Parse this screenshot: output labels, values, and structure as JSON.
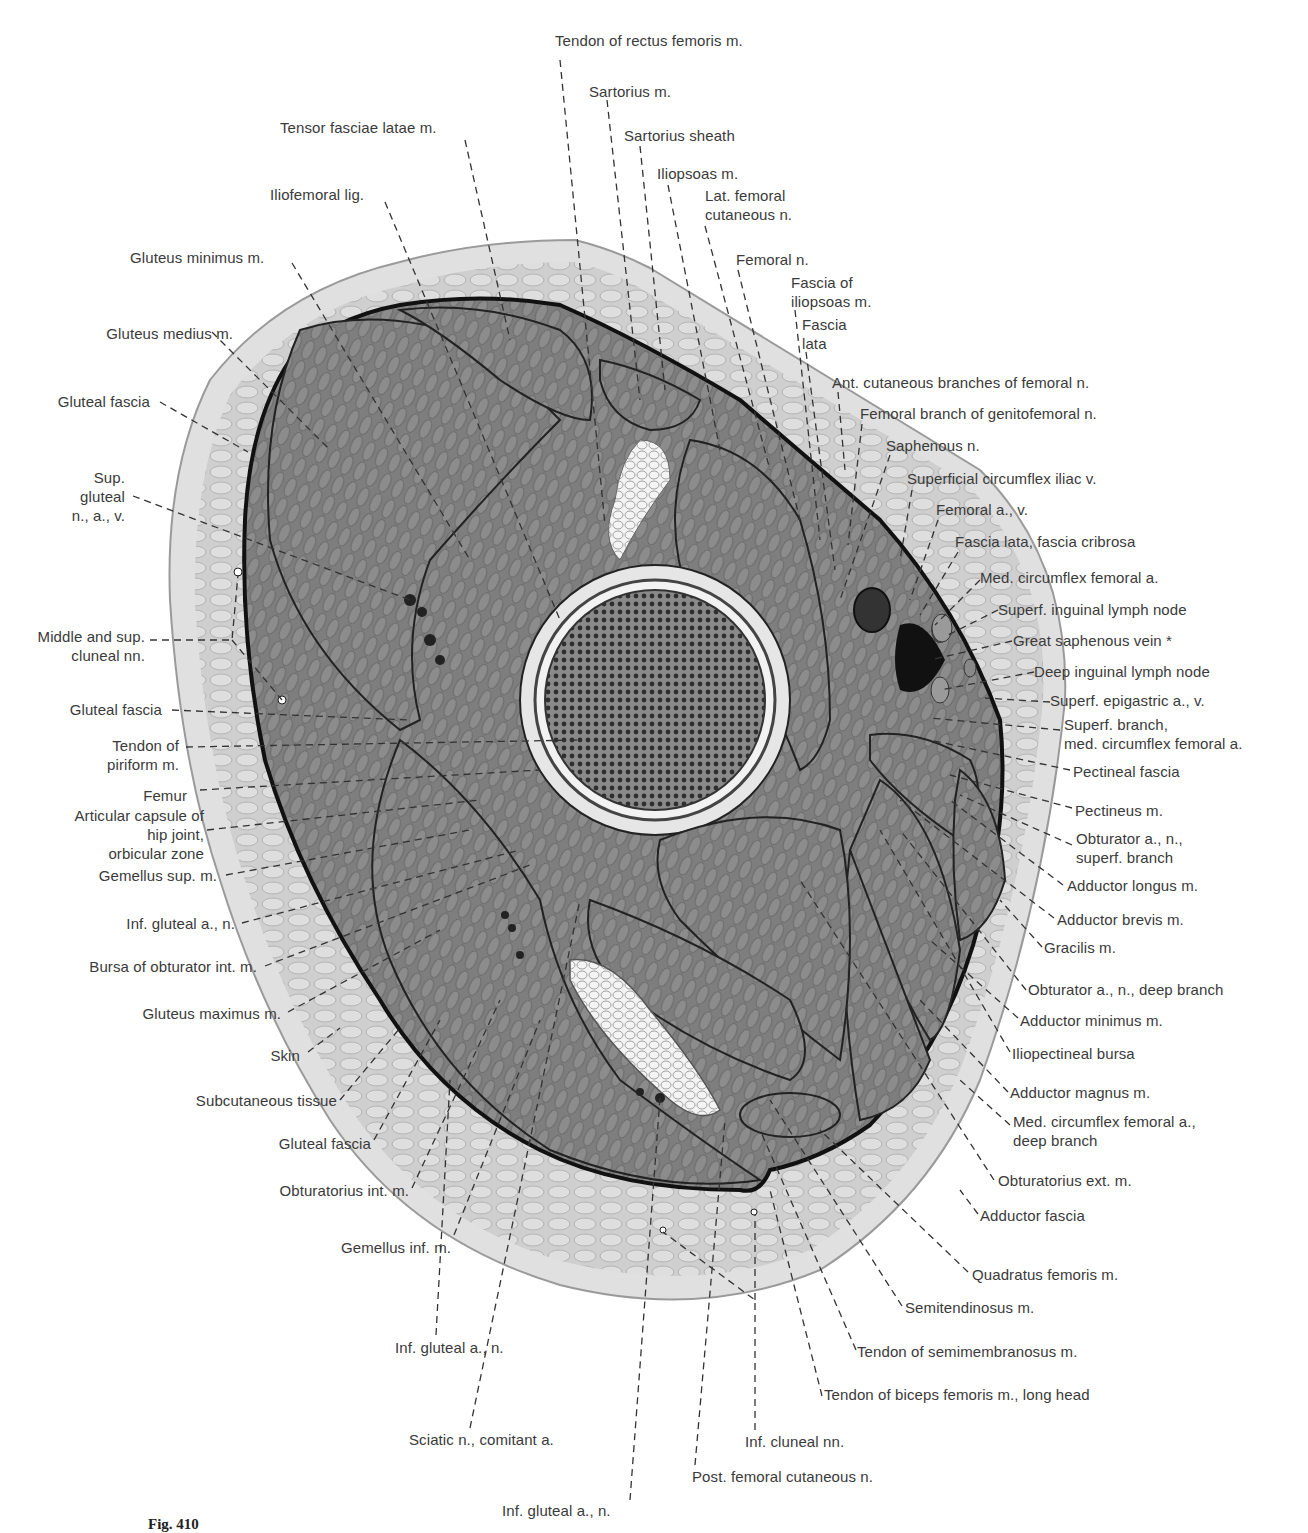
{
  "figure": {
    "caption_number": "Fig. 410"
  },
  "labels": {
    "top": [
      {
        "id": "tendon_rectus_femoris",
        "text": "Tendon of rectus femoris m.",
        "x": 555,
        "y": 40
      },
      {
        "id": "sartorius_m",
        "text": "Sartorius m.",
        "x": 589,
        "y": 82
      },
      {
        "id": "tensor_fasciae_latae",
        "text": "Tensor fasciae latae m.",
        "x": 280,
        "y": 118
      },
      {
        "id": "sartorius_sheath",
        "text": "Sartorius sheath",
        "x": 624,
        "y": 126
      },
      {
        "id": "iliopsoas_m",
        "text": "Iliopsoas m.",
        "x": 657,
        "y": 164
      },
      {
        "id": "iliofemoral_lig",
        "text": "Iliofemoral lig.",
        "x": 270,
        "y": 185
      },
      {
        "id": "lat_femoral_cutaneous",
        "text": "Lat. femoral\ncutaneous n.",
        "x": 705,
        "y": 186
      },
      {
        "id": "gluteus_minimus",
        "text": "Gluteus minimus m.",
        "x": 130,
        "y": 248
      },
      {
        "id": "femoral_n",
        "text": "Femoral n.",
        "x": 736,
        "y": 250
      },
      {
        "id": "fascia_iliopsoas",
        "text": "Fascia of\niliopsoas m.",
        "x": 791,
        "y": 273
      },
      {
        "id": "fascia_lata",
        "text": "Fascia\nlata",
        "x": 802,
        "y": 315
      }
    ],
    "left": [
      {
        "id": "gluteus_medius",
        "text": "Gluteus medius m.",
        "x": 232,
        "y": 325
      },
      {
        "id": "gluteal_fascia_1",
        "text": "Gluteal fascia",
        "x": 150,
        "y": 392
      },
      {
        "id": "sup_gluteal",
        "text": "Sup.\ngluteal\nn., a., v.",
        "x": 125,
        "y": 468
      },
      {
        "id": "middle_sup_cluneal",
        "text": "Middle and sup.\ncluneal nn.",
        "x": 145,
        "y": 627
      },
      {
        "id": "gluteal_fascia_2",
        "text": "Gluteal fascia",
        "x": 162,
        "y": 701
      },
      {
        "id": "tendon_piriform",
        "text": "Tendon of\npiriform m.",
        "x": 179,
        "y": 736
      },
      {
        "id": "femur",
        "text": "Femur",
        "x": 187,
        "y": 787
      },
      {
        "id": "articular_capsule",
        "text": "Articular capsule of\nhip joint,\norbicular zone",
        "x": 204,
        "y": 807
      },
      {
        "id": "gemellus_sup",
        "text": "Gemellus sup. m.",
        "x": 217,
        "y": 866
      },
      {
        "id": "inf_gluteal_left",
        "text": "Inf. gluteal a., n.",
        "x": 235,
        "y": 915
      },
      {
        "id": "bursa_obturator_int",
        "text": "Bursa of obturator int. m.",
        "x": 257,
        "y": 958
      },
      {
        "id": "gluteus_maximus",
        "text": "Gluteus maximus m.",
        "x": 281,
        "y": 1005
      },
      {
        "id": "skin",
        "text": "Skin",
        "x": 300,
        "y": 1046
      },
      {
        "id": "subcutaneous_tissue",
        "text": "Subcutaneous tissue",
        "x": 337,
        "y": 1092
      },
      {
        "id": "gluteal_fascia_3",
        "text": "Gluteal fascia",
        "x": 371,
        "y": 1135
      },
      {
        "id": "obturatorius_int",
        "text": "Obturatorius int. m.",
        "x": 409,
        "y": 1182
      },
      {
        "id": "gemellus_inf",
        "text": "Gemellus inf. m.",
        "x": 451,
        "y": 1239
      }
    ],
    "right": [
      {
        "id": "ant_cutaneous_branches",
        "text": "Ant. cutaneous branches of femoral n.",
        "x": 832,
        "y": 374
      },
      {
        "id": "femoral_branch_genitofemoral",
        "text": "Femoral branch of genitofemoral n.",
        "x": 860,
        "y": 405
      },
      {
        "id": "saphenous_n",
        "text": "Saphenous n.",
        "x": 886,
        "y": 436
      },
      {
        "id": "superficial_circumflex_iliac_v",
        "text": "Superficial circumflex iliac v.",
        "x": 907,
        "y": 469
      },
      {
        "id": "femoral_a_v",
        "text": "Femoral a., v.",
        "x": 936,
        "y": 500
      },
      {
        "id": "fascia_lata_cribrosa",
        "text": "Fascia lata, fascia cribrosa",
        "x": 955,
        "y": 532
      },
      {
        "id": "med_circumflex_femoral_a",
        "text": "Med. circumflex femoral a.",
        "x": 980,
        "y": 568
      },
      {
        "id": "superf_inguinal_lymph_node",
        "text": "Superf. inguinal lymph node",
        "x": 998,
        "y": 600
      },
      {
        "id": "great_saphenous_vein",
        "text": "Great saphenous vein *",
        "x": 1013,
        "y": 631
      },
      {
        "id": "deep_inguinal_lymph_node",
        "text": "Deep inguinal lymph node",
        "x": 1034,
        "y": 662
      },
      {
        "id": "superf_epigastric",
        "text": "Superf. epigastric a., v.",
        "x": 1050,
        "y": 692
      },
      {
        "id": "superf_branch_med_circumflex",
        "text": "Superf. branch,\nmed. circumflex femoral a.",
        "x": 1064,
        "y": 716
      },
      {
        "id": "pectineal_fascia",
        "text": "Pectineal fascia",
        "x": 1073,
        "y": 762
      },
      {
        "id": "pectineus",
        "text": "Pectineus m.",
        "x": 1075,
        "y": 801
      },
      {
        "id": "obturator_superf_branch",
        "text": "Obturator a., n.,\nsuperf. branch",
        "x": 1076,
        "y": 830
      },
      {
        "id": "adductor_longus",
        "text": "Adductor longus m.",
        "x": 1067,
        "y": 876
      },
      {
        "id": "adductor_brevis",
        "text": "Adductor brevis m.",
        "x": 1057,
        "y": 910
      },
      {
        "id": "gracilis",
        "text": "Gracilis m.",
        "x": 1044,
        "y": 938
      },
      {
        "id": "obturator_deep_branch",
        "text": "Obturator a., n., deep branch",
        "x": 1028,
        "y": 980
      },
      {
        "id": "adductor_minimus",
        "text": "Adductor minimus m.",
        "x": 1020,
        "y": 1011
      },
      {
        "id": "iliopectineal_bursa",
        "text": "Iliopectineal bursa",
        "x": 1012,
        "y": 1044
      },
      {
        "id": "adductor_magnus",
        "text": "Adductor magnus m.",
        "x": 1010,
        "y": 1084
      },
      {
        "id": "med_circumflex_deep_branch",
        "text": "Med. circumflex femoral a.,\ndeep branch",
        "x": 1013,
        "y": 1113
      },
      {
        "id": "obturatorius_ext",
        "text": "Obturatorius ext. m.",
        "x": 998,
        "y": 1172
      },
      {
        "id": "adductor_fascia",
        "text": "Adductor fascia",
        "x": 980,
        "y": 1206
      }
    ],
    "bottom": [
      {
        "id": "quadratus_femoris",
        "text": "Quadratus femoris m.",
        "x": 972,
        "y": 1265
      },
      {
        "id": "semitendinosus",
        "text": "Semitendinosus m.",
        "x": 905,
        "y": 1299
      },
      {
        "id": "tendon_semimembranosus",
        "text": "Tendon of semimembranosus m.",
        "x": 857,
        "y": 1343
      },
      {
        "id": "tendon_biceps_long_head",
        "text": "Tendon of biceps femoris m., long head",
        "x": 824,
        "y": 1386
      },
      {
        "id": "inf_gluteal_bottom_1",
        "text": "Inf. gluteal a., n.",
        "x": 395,
        "y": 1338
      },
      {
        "id": "sciatic_comitant",
        "text": "Sciatic n., comitant a.",
        "x": 409,
        "y": 1430
      },
      {
        "id": "inf_cluneal",
        "text": "Inf. cluneal nn.",
        "x": 745,
        "y": 1433
      },
      {
        "id": "post_femoral_cutaneous",
        "text": "Post. femoral cutaneous n.",
        "x": 692,
        "y": 1468
      },
      {
        "id": "inf_gluteal_bottom_2",
        "text": "Inf. gluteal a., n.",
        "x": 502,
        "y": 1502
      }
    ]
  },
  "colors": {
    "skin_outer": "#d9d9d9",
    "subcutaneous": "#c9c9c9",
    "muscle": "#7d7d7d",
    "fascia_line": "#111111",
    "bone_marrow": "#4a4a4a",
    "text": "#3a3a3a",
    "background": "#ffffff"
  }
}
